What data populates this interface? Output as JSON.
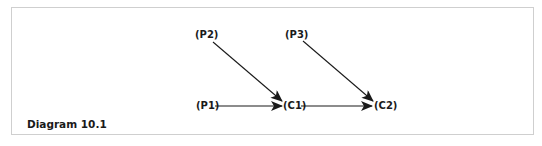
{
  "caption": "Diagram 10.1",
  "nodes": [
    {
      "id": "P2",
      "label": "(P2)",
      "x": 195,
      "y": 38
    },
    {
      "id": "P3",
      "label": "(P3)",
      "x": 285,
      "y": 38
    },
    {
      "id": "P1",
      "label": "(P1)",
      "x": 196,
      "y": 109
    },
    {
      "id": "C1",
      "label": "(C1)",
      "x": 283,
      "y": 109
    },
    {
      "id": "C2",
      "label": "(C2)",
      "x": 374,
      "y": 109
    }
  ],
  "edges": [
    {
      "from": "P2",
      "to": "C1"
    },
    {
      "from": "P3",
      "to": "C2"
    },
    {
      "from": "P1",
      "to": "C1"
    },
    {
      "from": "C1",
      "to": "C2"
    }
  ],
  "colors": {
    "border": "#cfcfcf",
    "line": "#1a1a1a",
    "text": "#1a1a1a"
  }
}
